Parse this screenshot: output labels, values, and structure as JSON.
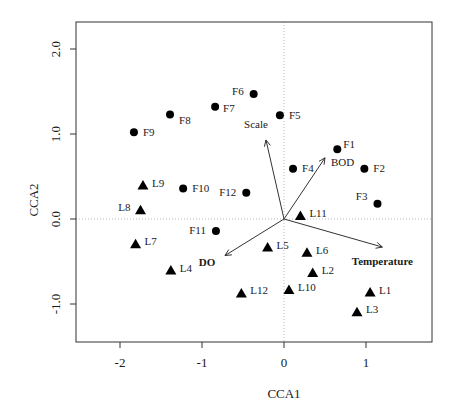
{
  "chart_data": {
    "type": "scatter",
    "title": "",
    "xlabel": "CCA1",
    "ylabel": "CCA2",
    "xlim": [
      -2.5,
      1.75
    ],
    "ylim": [
      -1.45,
      2.3
    ],
    "xticks": [
      -2,
      -1,
      0,
      1
    ],
    "xtick_labels": [
      "-2",
      "-1",
      "0",
      "1"
    ],
    "yticks": [
      -1.0,
      0.0,
      1.0,
      2.0
    ],
    "ytick_labels": [
      "-1.0",
      "0.0",
      "1.0",
      "2.0"
    ],
    "reference_lines": {
      "x": 0,
      "y": 0,
      "style": "dotted"
    },
    "series": [
      {
        "name": "F",
        "marker": "circle",
        "points": [
          {
            "label": "F1",
            "x": 0.65,
            "y": 0.82
          },
          {
            "label": "F2",
            "x": 0.98,
            "y": 0.59
          },
          {
            "label": "F3",
            "x": 1.14,
            "y": 0.18
          },
          {
            "label": "F4",
            "x": 0.11,
            "y": 0.59
          },
          {
            "label": "F5",
            "x": -0.05,
            "y": 1.22
          },
          {
            "label": "F6",
            "x": -0.37,
            "y": 1.47
          },
          {
            "label": "F7",
            "x": -0.84,
            "y": 1.32
          },
          {
            "label": "F8",
            "x": -1.39,
            "y": 1.23
          },
          {
            "label": "F9",
            "x": -1.83,
            "y": 1.02
          },
          {
            "label": "F10",
            "x": -1.23,
            "y": 0.36
          },
          {
            "label": "F11",
            "x": -0.83,
            "y": -0.14
          },
          {
            "label": "F12",
            "x": -0.46,
            "y": 0.31
          }
        ]
      },
      {
        "name": "L",
        "marker": "triangle",
        "points": [
          {
            "label": "L1",
            "x": 1.05,
            "y": -0.86
          },
          {
            "label": "L2",
            "x": 0.35,
            "y": -0.63
          },
          {
            "label": "L3",
            "x": 0.89,
            "y": -1.09
          },
          {
            "label": "L4",
            "x": -1.38,
            "y": -0.6
          },
          {
            "label": "L5",
            "x": -0.2,
            "y": -0.33
          },
          {
            "label": "L6",
            "x": 0.28,
            "y": -0.39
          },
          {
            "label": "L7",
            "x": -1.81,
            "y": -0.29
          },
          {
            "label": "L8",
            "x": -1.75,
            "y": 0.11
          },
          {
            "label": "L9",
            "x": -1.72,
            "y": 0.4
          },
          {
            "label": "L10",
            "x": 0.06,
            "y": -0.83
          },
          {
            "label": "L11",
            "x": 0.2,
            "y": 0.04
          },
          {
            "label": "L12",
            "x": -0.52,
            "y": -0.87
          }
        ]
      }
    ],
    "arrows": [
      {
        "label": "Scale",
        "x": -0.22,
        "y": 0.93,
        "bold": false
      },
      {
        "label": "BOD",
        "x": 0.5,
        "y": 0.72,
        "bold": false
      },
      {
        "label": "DO",
        "x": -0.72,
        "y": -0.43,
        "bold": true
      },
      {
        "label": "Temperature",
        "x": 1.2,
        "y": -0.33,
        "bold": true
      }
    ],
    "arrow_origin": {
      "x": 0.0,
      "y": 0.0
    }
  }
}
